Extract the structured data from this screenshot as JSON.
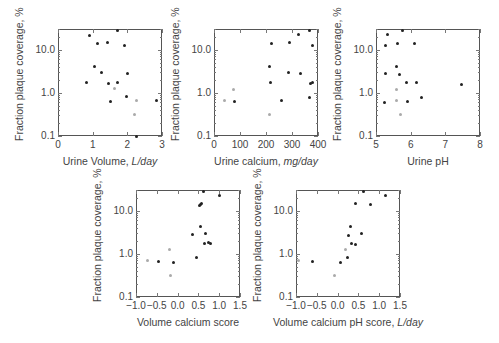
{
  "figure": {
    "ylabel": "Fraction plaque coverage, %",
    "colors": {
      "filled": "#222222",
      "gray": "#aaaaaa",
      "frame": "#555555"
    }
  },
  "chart_data": [
    {
      "type": "scatter",
      "xlabel": "Urine Volume, ",
      "xlabel_italic": "L/day",
      "ylabel": "Fraction plaque coverage, %",
      "yscale": "log",
      "ylim": [
        0.1,
        30
      ],
      "xlim": [
        0,
        3
      ],
      "xticks": [
        "0",
        "1",
        "2",
        "3"
      ],
      "yticks": [
        "0.1",
        "1.0",
        "10.0"
      ],
      "series": [
        {
          "name": "black",
          "points": [
            [
              0.9,
              21
            ],
            [
              1.15,
              14
            ],
            [
              1.43,
              14.5
            ],
            [
              1.72,
              28
            ],
            [
              1.92,
              12.5
            ],
            [
              1.05,
              4
            ],
            [
              1.25,
              3
            ],
            [
              0.82,
              1.75
            ],
            [
              1.45,
              1.6
            ],
            [
              1.72,
              1.75
            ],
            [
              2.0,
              2.8
            ],
            [
              1.5,
              0.62
            ],
            [
              1.98,
              0.8
            ],
            [
              2.85,
              0.65
            ],
            [
              2.25,
              0.1
            ]
          ]
        },
        {
          "name": "gray",
          "points": [
            [
              1.62,
              1.25
            ],
            [
              2.25,
              0.68
            ],
            [
              2.22,
              0.32
            ]
          ]
        }
      ]
    },
    {
      "type": "scatter",
      "xlabel": "Urine calcium, ",
      "xlabel_italic": "mg/day",
      "ylabel": "Fraction plaque coverage, %",
      "yscale": "log",
      "ylim": [
        0.1,
        30
      ],
      "xlim": [
        0,
        400
      ],
      "xticks": [
        "0",
        "100",
        "200",
        "300",
        "400"
      ],
      "yticks": [
        "0.1",
        "1.0",
        "10.0"
      ],
      "series": [
        {
          "name": "black",
          "points": [
            [
              325,
              22
            ],
            [
              368,
              28
            ],
            [
              222,
              14
            ],
            [
              292,
              14.5
            ],
            [
              378,
              12.5
            ],
            [
              212,
              4
            ],
            [
              285,
              3
            ],
            [
              332,
              2.8
            ],
            [
              218,
              1.75
            ],
            [
              372,
              1.6
            ],
            [
              378,
              1.7
            ],
            [
              258,
              0.65
            ],
            [
              368,
              0.78
            ],
            [
              78,
              0.62
            ]
          ]
        },
        {
          "name": "gray",
          "points": [
            [
              42,
              0.68
            ],
            [
              75,
              1.2
            ],
            [
              215,
              0.32
            ]
          ]
        }
      ]
    },
    {
      "type": "scatter",
      "xlabel": "Urine pH",
      "xlabel_italic": "",
      "ylabel": "Fraction plaque coverage, %",
      "yscale": "log",
      "ylim": [
        0.1,
        30
      ],
      "xlim": [
        5,
        8
      ],
      "xticks": [
        "5",
        "6",
        "7",
        "8"
      ],
      "yticks": [
        "0.1",
        "1.0",
        "10.0"
      ],
      "series": [
        {
          "name": "black",
          "points": [
            [
              5.32,
              22
            ],
            [
              5.75,
              28
            ],
            [
              5.28,
              12.5
            ],
            [
              5.62,
              14
            ],
            [
              6.1,
              13.5
            ],
            [
              5.6,
              4
            ],
            [
              5.28,
              2.8
            ],
            [
              5.68,
              2.7
            ],
            [
              5.88,
              1.75
            ],
            [
              6.18,
              1.7
            ],
            [
              7.48,
              1.55
            ],
            [
              5.25,
              0.6
            ],
            [
              5.92,
              0.62
            ],
            [
              6.32,
              0.78
            ]
          ]
        },
        {
          "name": "gray",
          "points": [
            [
              5.58,
              1.2
            ],
            [
              5.58,
              0.68
            ],
            [
              5.72,
              0.32
            ]
          ]
        }
      ]
    },
    {
      "type": "scatter",
      "xlabel": "Volume calcium score",
      "xlabel_italic": "",
      "ylabel": "Fraction plaque coverage, %",
      "yscale": "log",
      "ylim": [
        0.1,
        30
      ],
      "xlim": [
        -1.0,
        1.5
      ],
      "xticks": [
        "−1.0",
        "−0.5",
        "0.0",
        "0.5",
        "1.0",
        "1.5"
      ],
      "yticks": [
        "0.1",
        "1.0",
        "10.0"
      ],
      "series": [
        {
          "name": "black",
          "points": [
            [
              0.62,
              28
            ],
            [
              1.0,
              22
            ],
            [
              0.52,
              13
            ],
            [
              0.55,
              14
            ],
            [
              0.58,
              14.5
            ],
            [
              0.55,
              4.3
            ],
            [
              0.35,
              2.8
            ],
            [
              0.68,
              3.0
            ],
            [
              0.65,
              1.75
            ],
            [
              0.74,
              1.8
            ],
            [
              0.8,
              1.7
            ],
            [
              0.45,
              0.82
            ],
            [
              -0.45,
              0.68
            ],
            [
              -0.1,
              0.62
            ]
          ]
        },
        {
          "name": "gray",
          "points": [
            [
              -0.72,
              0.7
            ],
            [
              -0.2,
              1.25
            ],
            [
              -0.18,
              0.32
            ]
          ]
        }
      ]
    },
    {
      "type": "scatter",
      "xlabel": "Volume calcium pH score, ",
      "xlabel_italic": "L/day",
      "ylabel": "Fraction plaque coverage, %",
      "yscale": "log",
      "ylim": [
        0.1,
        30
      ],
      "xlim": [
        -1.0,
        1.5
      ],
      "xticks": [
        "−1.0",
        "−0.5",
        "0.0",
        "0.5",
        "1.0",
        "1.5"
      ],
      "yticks": [
        "0.1",
        "1.0",
        "10.0"
      ],
      "series": [
        {
          "name": "black",
          "points": [
            [
              0.62,
              27
            ],
            [
              1.15,
              22
            ],
            [
              0.42,
              14.5
            ],
            [
              0.8,
              13.5
            ],
            [
              0.3,
              4.2
            ],
            [
              0.25,
              2.7
            ],
            [
              0.58,
              3.0
            ],
            [
              0.33,
              1.7
            ],
            [
              0.42,
              1.6
            ],
            [
              0.23,
              0.8
            ],
            [
              0.07,
              0.62
            ],
            [
              -0.6,
              0.66
            ]
          ]
        },
        {
          "name": "gray",
          "points": [
            [
              -0.95,
              0.7
            ],
            [
              0.2,
              1.25
            ],
            [
              -0.08,
              0.32
            ]
          ]
        }
      ]
    }
  ],
  "layout": {
    "panels": [
      {
        "left": 58,
        "top": 29,
        "width": 104,
        "height": 107
      },
      {
        "left": 214,
        "top": 29,
        "width": 104,
        "height": 107
      },
      {
        "left": 376,
        "top": 29,
        "width": 104,
        "height": 107
      },
      {
        "left": 136,
        "top": 190,
        "width": 104,
        "height": 107
      },
      {
        "left": 296,
        "top": 190,
        "width": 104,
        "height": 107
      }
    ]
  }
}
